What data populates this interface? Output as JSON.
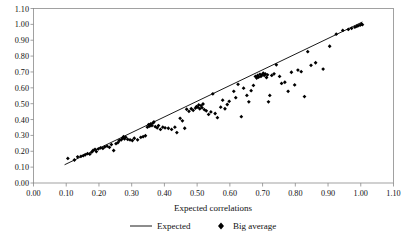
{
  "chart_data": {
    "type": "scatter",
    "title": "",
    "xlabel": "Expected correlations",
    "ylabel": "",
    "xlim": [
      0.0,
      1.1
    ],
    "ylim": [
      0.0,
      1.1
    ],
    "grid": false,
    "legend_position": "bottom",
    "x_ticks": [
      "0.00",
      "0.10",
      "0.20",
      "0.30",
      "0.40",
      "0.50",
      "0.60",
      "0.70",
      "0.80",
      "0.90",
      "1.00",
      "1.10"
    ],
    "y_ticks": [
      "0.00",
      "0.10",
      "0.20",
      "0.30",
      "0.40",
      "0.50",
      "0.60",
      "0.70",
      "0.80",
      "0.90",
      "1.00",
      "1.10"
    ],
    "x_tick_values": [
      0.0,
      0.1,
      0.2,
      0.3,
      0.4,
      0.5,
      0.6,
      0.7,
      0.8,
      0.9,
      1.0,
      1.1
    ],
    "y_tick_values": [
      0.0,
      0.1,
      0.2,
      0.3,
      0.4,
      0.5,
      0.6,
      0.7,
      0.8,
      0.9,
      1.0,
      1.1
    ],
    "series": [
      {
        "name": "Expected",
        "type": "line",
        "marker": "none",
        "color": "#000000",
        "x": [
          0.095,
          1.005
        ],
        "y": [
          0.115,
          1.015
        ]
      },
      {
        "name": "Big average",
        "type": "scatter",
        "marker": "diamond",
        "color": "#000000",
        "points": [
          [
            0.105,
            0.155
          ],
          [
            0.125,
            0.145
          ],
          [
            0.135,
            0.165
          ],
          [
            0.145,
            0.168
          ],
          [
            0.152,
            0.172
          ],
          [
            0.158,
            0.178
          ],
          [
            0.165,
            0.185
          ],
          [
            0.172,
            0.182
          ],
          [
            0.178,
            0.195
          ],
          [
            0.182,
            0.205
          ],
          [
            0.188,
            0.212
          ],
          [
            0.192,
            0.198
          ],
          [
            0.198,
            0.215
          ],
          [
            0.205,
            0.222
          ],
          [
            0.212,
            0.218
          ],
          [
            0.218,
            0.228
          ],
          [
            0.225,
            0.232
          ],
          [
            0.232,
            0.225
          ],
          [
            0.238,
            0.242
          ],
          [
            0.245,
            0.205
          ],
          [
            0.252,
            0.248
          ],
          [
            0.258,
            0.255
          ],
          [
            0.262,
            0.268
          ],
          [
            0.268,
            0.272
          ],
          [
            0.272,
            0.282
          ],
          [
            0.275,
            0.292
          ],
          [
            0.278,
            0.278
          ],
          [
            0.282,
            0.288
          ],
          [
            0.288,
            0.275
          ],
          [
            0.295,
            0.272
          ],
          [
            0.302,
            0.268
          ],
          [
            0.308,
            0.282
          ],
          [
            0.318,
            0.272
          ],
          [
            0.328,
            0.288
          ],
          [
            0.335,
            0.292
          ],
          [
            0.342,
            0.298
          ],
          [
            0.348,
            0.352
          ],
          [
            0.352,
            0.368
          ],
          [
            0.355,
            0.358
          ],
          [
            0.358,
            0.372
          ],
          [
            0.362,
            0.362
          ],
          [
            0.365,
            0.378
          ],
          [
            0.368,
            0.385
          ],
          [
            0.372,
            0.355
          ],
          [
            0.378,
            0.348
          ],
          [
            0.382,
            0.362
          ],
          [
            0.388,
            0.338
          ],
          [
            0.395,
            0.352
          ],
          [
            0.402,
            0.348
          ],
          [
            0.412,
            0.345
          ],
          [
            0.422,
            0.338
          ],
          [
            0.432,
            0.352
          ],
          [
            0.438,
            0.318
          ],
          [
            0.448,
            0.408
          ],
          [
            0.455,
            0.392
          ],
          [
            0.462,
            0.345
          ],
          [
            0.468,
            0.465
          ],
          [
            0.475,
            0.452
          ],
          [
            0.482,
            0.468
          ],
          [
            0.488,
            0.458
          ],
          [
            0.495,
            0.472
          ],
          [
            0.498,
            0.482
          ],
          [
            0.502,
            0.478
          ],
          [
            0.505,
            0.492
          ],
          [
            0.508,
            0.468
          ],
          [
            0.512,
            0.488
          ],
          [
            0.515,
            0.475
          ],
          [
            0.518,
            0.498
          ],
          [
            0.522,
            0.462
          ],
          [
            0.528,
            0.455
          ],
          [
            0.535,
            0.432
          ],
          [
            0.542,
            0.448
          ],
          [
            0.548,
            0.562
          ],
          [
            0.555,
            0.438
          ],
          [
            0.562,
            0.412
          ],
          [
            0.572,
            0.478
          ],
          [
            0.578,
            0.522
          ],
          [
            0.585,
            0.468
          ],
          [
            0.592,
            0.495
          ],
          [
            0.598,
            0.515
          ],
          [
            0.612,
            0.578
          ],
          [
            0.618,
            0.538
          ],
          [
            0.625,
            0.622
          ],
          [
            0.635,
            0.418
          ],
          [
            0.642,
            0.598
          ],
          [
            0.652,
            0.552
          ],
          [
            0.658,
            0.512
          ],
          [
            0.665,
            0.582
          ],
          [
            0.672,
            0.615
          ],
          [
            0.678,
            0.672
          ],
          [
            0.682,
            0.662
          ],
          [
            0.685,
            0.678
          ],
          [
            0.688,
            0.668
          ],
          [
            0.692,
            0.685
          ],
          [
            0.695,
            0.672
          ],
          [
            0.698,
            0.682
          ],
          [
            0.702,
            0.692
          ],
          [
            0.705,
            0.678
          ],
          [
            0.708,
            0.688
          ],
          [
            0.712,
            0.665
          ],
          [
            0.715,
            0.682
          ],
          [
            0.718,
            0.512
          ],
          [
            0.722,
            0.552
          ],
          [
            0.728,
            0.678
          ],
          [
            0.735,
            0.688
          ],
          [
            0.742,
            0.745
          ],
          [
            0.752,
            0.672
          ],
          [
            0.758,
            0.628
          ],
          [
            0.768,
            0.635
          ],
          [
            0.778,
            0.578
          ],
          [
            0.788,
            0.698
          ],
          [
            0.798,
            0.618
          ],
          [
            0.808,
            0.712
          ],
          [
            0.818,
            0.702
          ],
          [
            0.828,
            0.545
          ],
          [
            0.838,
            0.828
          ],
          [
            0.848,
            0.742
          ],
          [
            0.862,
            0.758
          ],
          [
            0.885,
            0.718
          ],
          [
            0.905,
            0.862
          ],
          [
            0.925,
            0.938
          ],
          [
            0.945,
            0.962
          ],
          [
            0.962,
            0.968
          ],
          [
            0.972,
            0.975
          ],
          [
            0.982,
            0.982
          ],
          [
            0.988,
            0.988
          ],
          [
            0.992,
            0.992
          ],
          [
            0.998,
            0.995
          ],
          [
            1.002,
            1.002
          ],
          [
            1.005,
            0.998
          ]
        ]
      }
    ]
  },
  "legend": {
    "entries": [
      {
        "label": "Expected",
        "marker": "line",
        "color": "#000000"
      },
      {
        "label": "Big average",
        "marker": "diamond",
        "color": "#000000"
      }
    ]
  }
}
